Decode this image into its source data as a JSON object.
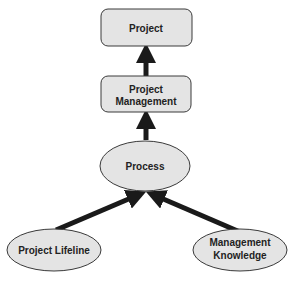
{
  "diagram": {
    "nodes": {
      "project": {
        "label": "Project",
        "shape": "rounded-rect"
      },
      "project_management": {
        "label_line1": "Project",
        "label_line2": "Management",
        "shape": "rounded-rect"
      },
      "process": {
        "label": "Process",
        "shape": "ellipse"
      },
      "project_lifeline": {
        "label": "Project Lifeline",
        "shape": "ellipse"
      },
      "management_knowledge": {
        "label_line1": "Management",
        "label_line2": "Knowledge",
        "shape": "ellipse"
      }
    },
    "edges": [
      {
        "from": "project_management",
        "to": "project"
      },
      {
        "from": "process",
        "to": "project_management"
      },
      {
        "from": "project_lifeline",
        "to": "process"
      },
      {
        "from": "management_knowledge",
        "to": "process"
      }
    ],
    "colors": {
      "node_fill": "#e4e4e4",
      "node_stroke": "#3a3a3a",
      "arrow": "#1a1a1a",
      "text": "#222222"
    }
  }
}
